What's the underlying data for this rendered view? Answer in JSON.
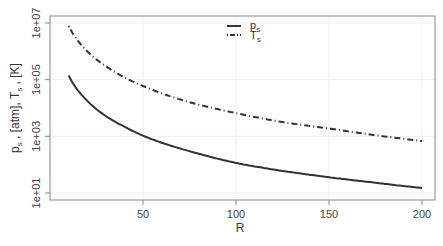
{
  "chart_data": {
    "type": "line",
    "title": "",
    "xlabel": "R",
    "ylabel": "p_s , [atm],  T_s , [K]",
    "yscale": "log",
    "xlim": [
      5,
      208
    ],
    "ylim": [
      10,
      10000000
    ],
    "grid": true,
    "legend_position": "top-center",
    "x_ticks": [
      50,
      100,
      150,
      200
    ],
    "x_tick_labels": [
      "50",
      "100",
      "150",
      "200"
    ],
    "y_ticks": [
      10,
      1000,
      100000,
      10000000
    ],
    "y_tick_labels": [
      "1e+01",
      "1e+03",
      "1e+05",
      "1e+07"
    ],
    "x": [
      10,
      20,
      30,
      40,
      50,
      75,
      100,
      125,
      150,
      175,
      200
    ],
    "series": [
      {
        "name": "p_s",
        "style": "solid",
        "values": [
          140000,
          18000,
          5200,
          2200,
          1050,
          300,
          115,
          60,
          36,
          23,
          15
        ]
      },
      {
        "name": "T_s",
        "style": "dashdot",
        "values": [
          7800000,
          1000000,
          300000,
          120000,
          60000,
          16000,
          6600,
          3200,
          1900,
          1100,
          680
        ]
      }
    ]
  },
  "axes": {
    "xlabel": "R",
    "ylabel_p": "p",
    "ylabel_p_sub": "s",
    "ylabel_mid1": " , [atm],  ",
    "ylabel_T": "T",
    "ylabel_T_sub": "s",
    "ylabel_end": " , [K]"
  },
  "legend": {
    "items": [
      {
        "label": "p",
        "sub": "s"
      },
      {
        "label": "T",
        "sub": "s"
      }
    ]
  }
}
